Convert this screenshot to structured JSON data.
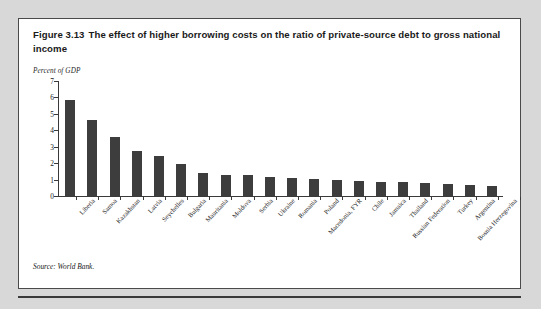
{
  "figure": {
    "number": "Figure 3.13",
    "title": "The effect of higher borrowing costs on the ratio of private-source debt to gross national income",
    "units_note": "Percent of GDP",
    "source": "Source: World Bank."
  },
  "colors": {
    "bar_fill": "#3d3d3d",
    "axis": "#3a3a3a",
    "card_background": "#ffffff",
    "card_border": "#4a4a4a",
    "page_background": "#d8d8d8",
    "text": "#1a1a1a"
  },
  "chart_data": {
    "type": "bar",
    "xlabel": "",
    "ylabel": "Percent of GDP",
    "ylim": [
      0,
      7
    ],
    "yticks": [
      0,
      1,
      2,
      3,
      4,
      5,
      6,
      7
    ],
    "ytick_labels": [
      "0",
      "1",
      "2",
      "3",
      "4",
      "5",
      "6",
      "7"
    ],
    "grid": false,
    "legend": false,
    "categories": [
      "Liberia",
      "Samoa",
      "Kazakhstan",
      "Latvia",
      "Seychelles",
      "Bulgaria",
      "Mauritania",
      "Moldova",
      "Serbia",
      "Ukraine",
      "Romania",
      "Poland",
      "Macedonia, FYR",
      "Chile",
      "Jamaica",
      "Thailand",
      "Russian Federation",
      "Turkey",
      "Argentina",
      "Bosnia Herzegovina"
    ],
    "values": [
      5.85,
      4.62,
      3.62,
      2.72,
      2.45,
      1.95,
      1.42,
      1.27,
      1.25,
      1.18,
      1.1,
      1.05,
      0.98,
      0.92,
      0.88,
      0.85,
      0.8,
      0.72,
      0.7,
      0.62
    ]
  }
}
